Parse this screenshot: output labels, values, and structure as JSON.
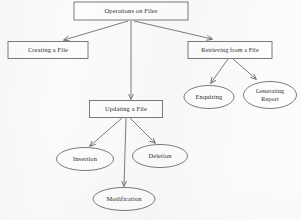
{
  "diagram": {
    "title_node": "Operations on Files",
    "type": "flowchart-tree",
    "nodes": [
      {
        "id": "root",
        "label": "Operations on Files",
        "shape": "rectangle",
        "cx": 131,
        "cy": 11,
        "w": 114,
        "h": 18
      },
      {
        "id": "creating",
        "label": "Creating a File",
        "shape": "rectangle",
        "cx": 48,
        "cy": 50,
        "w": 80,
        "h": 17
      },
      {
        "id": "retrieving",
        "label": "Retrieving from a File",
        "shape": "rectangle",
        "cx": 230,
        "cy": 50,
        "w": 84,
        "h": 17
      },
      {
        "id": "updating",
        "label": "Updating a File",
        "shape": "rectangle",
        "cx": 126,
        "cy": 109,
        "w": 73,
        "h": 17
      },
      {
        "id": "enquiring",
        "label": "Enquiring",
        "shape": "ellipse",
        "cx": 209,
        "cy": 97,
        "w": 50,
        "h": 23
      },
      {
        "id": "generating",
        "label": "Generating Report",
        "shape": "ellipse",
        "cx": 270,
        "cy": 95,
        "w": 53,
        "h": 27,
        "lines": [
          "Generating",
          "Report"
        ]
      },
      {
        "id": "insertion",
        "label": "Insertion",
        "shape": "ellipse",
        "cx": 85,
        "cy": 159,
        "w": 57,
        "h": 23
      },
      {
        "id": "deletion",
        "label": "Deletion",
        "shape": "ellipse",
        "cx": 160,
        "cy": 156,
        "w": 55,
        "h": 23
      },
      {
        "id": "modification",
        "label": "Modification",
        "shape": "ellipse",
        "cx": 124,
        "cy": 199,
        "w": 62,
        "h": 23
      }
    ],
    "edges": [
      {
        "from": "root",
        "to": "creating"
      },
      {
        "from": "root",
        "to": "retrieving"
      },
      {
        "from": "root",
        "to": "updating"
      },
      {
        "from": "retrieving",
        "to": "enquiring"
      },
      {
        "from": "retrieving",
        "to": "generating"
      },
      {
        "from": "updating",
        "to": "insertion"
      },
      {
        "from": "updating",
        "to": "deletion"
      },
      {
        "from": "updating",
        "to": "modification"
      }
    ],
    "colors": {
      "stroke": "#7a7a7a",
      "edge": "#6e6e6e",
      "text": "#2b2b2b",
      "node_fill": "#fdfdfd",
      "background": "#fbfbfb"
    }
  }
}
